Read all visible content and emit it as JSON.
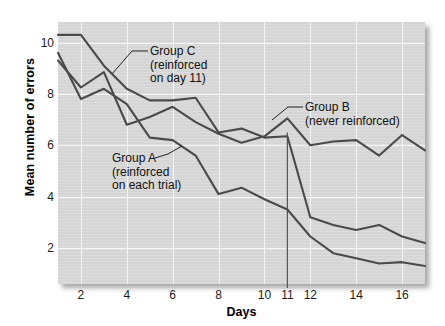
{
  "chart_data": {
    "type": "line",
    "title": "",
    "xlabel": "Days",
    "ylabel": "Mean number of errors",
    "xlim": [
      1,
      17
    ],
    "ylim": [
      0.6,
      10.8
    ],
    "xticks": [
      2,
      4,
      6,
      8,
      10,
      11,
      12,
      14,
      16
    ],
    "yticks": [
      2,
      4,
      6,
      8,
      10
    ],
    "grid": true,
    "legend_position": "inline-annotations",
    "x": [
      1,
      2,
      3,
      4,
      5,
      6,
      7,
      8,
      9,
      10,
      11,
      12,
      13,
      14,
      15,
      16,
      17
    ],
    "series": [
      {
        "name": "Group A",
        "annotation": "Group A\n(reinforced\non each trial)",
        "values": [
          9.6,
          7.8,
          8.2,
          7.6,
          6.3,
          6.2,
          5.6,
          4.1,
          4.35,
          3.9,
          3.5,
          2.45,
          1.8,
          1.6,
          1.4,
          1.45,
          1.3
        ]
      },
      {
        "name": "Group B",
        "annotation": "Group B\n(never reinforced)",
        "values": [
          9.3,
          8.25,
          8.85,
          6.8,
          7.1,
          7.5,
          6.9,
          6.45,
          6.1,
          6.35,
          7.05,
          6.0,
          6.15,
          6.2,
          5.6,
          6.4,
          5.8
        ]
      },
      {
        "name": "Group C",
        "annotation": "Group C\n(reinforced\non day 11)",
        "values": [
          10.3,
          10.3,
          9.1,
          8.2,
          7.75,
          7.75,
          7.85,
          6.5,
          6.65,
          6.3,
          6.35,
          3.2,
          2.9,
          2.7,
          2.9,
          2.45,
          2.2
        ]
      }
    ],
    "marker_line": {
      "day": 11,
      "label": "11"
    },
    "colors": {
      "panel_background": "#d9d9d9",
      "gridline": "#f5f5f5",
      "line": "#4a4a4a",
      "text": "#111111",
      "page_background": "#ffffff"
    }
  },
  "axis": {
    "y_title": "Mean number of errors",
    "x_title": "Days",
    "y_tick_labels": [
      "10",
      "8",
      "6",
      "4",
      "2"
    ],
    "x_tick_labels": [
      "2",
      "4",
      "6",
      "8",
      "10",
      "11",
      "12",
      "14",
      "16"
    ]
  },
  "annotations": {
    "group_c": {
      "line1": "Group C",
      "line2": "(reinforced",
      "line3": "on day 11)"
    },
    "group_b": {
      "line1": "Group B",
      "line2": "(never reinforced)"
    },
    "group_a": {
      "line1": "Group A",
      "line2": "(reinforced",
      "line3": "on each trial)"
    }
  }
}
